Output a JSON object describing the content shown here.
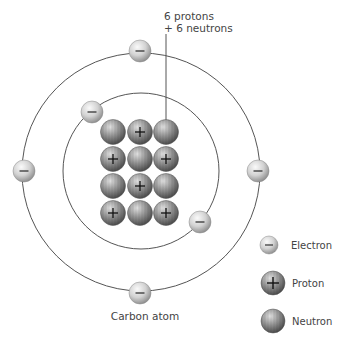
{
  "diagram": {
    "title": "Carbon atom",
    "nucleus_label_line1": "6 protons",
    "nucleus_label_line2": "+ 6 neutrons",
    "colors": {
      "orbit": "#555555",
      "electron_light": "#f4f4f4",
      "electron_dark": "#9a9a9a",
      "nucleon_light": "#d8d8d8",
      "nucleon_dark": "#5e5e5e",
      "label_text": "#444444"
    },
    "orbits": [
      {
        "name": "outer-shell",
        "cx": 141,
        "cy": 172,
        "r": 119
      },
      {
        "name": "inner-shell",
        "cx": 141,
        "cy": 171,
        "r": 78
      }
    ],
    "electrons": [
      {
        "shell": "inner",
        "x": 92,
        "y": 112
      },
      {
        "shell": "inner",
        "x": 200,
        "y": 222
      },
      {
        "shell": "outer",
        "x": 140,
        "y": 51
      },
      {
        "shell": "outer",
        "x": 24,
        "y": 171
      },
      {
        "shell": "outer",
        "x": 258,
        "y": 171
      },
      {
        "shell": "outer",
        "x": 140,
        "y": 293
      }
    ],
    "nucleus": {
      "columns_x": [
        113,
        140,
        166
      ],
      "rows_y": [
        132,
        159,
        186,
        213
      ],
      "grid": [
        [
          "neutron",
          "proton",
          "neutron"
        ],
        [
          "proton",
          "neutron",
          "proton"
        ],
        [
          "neutron",
          "proton",
          "neutron"
        ],
        [
          "proton",
          "neutron",
          "proton"
        ]
      ]
    },
    "legend": [
      {
        "type": "electron",
        "label": "Electron",
        "symbol": "−"
      },
      {
        "type": "proton",
        "label": "Proton",
        "symbol": "+"
      },
      {
        "type": "neutron",
        "label": "Neutron",
        "symbol": ""
      }
    ]
  }
}
